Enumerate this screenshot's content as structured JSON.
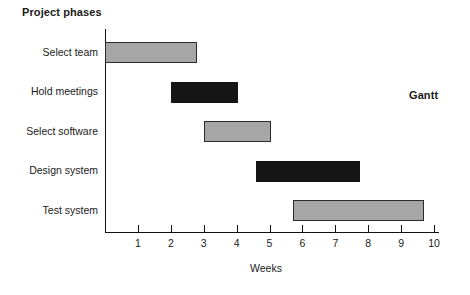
{
  "titles": {
    "phases": "Project phases",
    "gantt": "Gantt",
    "x_axis": "Weeks"
  },
  "chart_data": {
    "type": "bar",
    "orientation": "horizontal",
    "subtype": "gantt",
    "title": "Project phases",
    "annotation": "Gantt",
    "xlabel": "Weeks",
    "ylabel": "",
    "xlim": [
      0,
      10
    ],
    "grid": false,
    "legend": null,
    "xticks": [
      "1",
      "2",
      "3",
      "4",
      "5",
      "6",
      "7",
      "8",
      "9",
      "10"
    ],
    "categories": [
      "Select team",
      "Hold meetings",
      "Select software",
      "Design system",
      "Test system"
    ],
    "tasks": [
      {
        "name": "Select team",
        "start": 0,
        "end": 2.8,
        "duration": 2.8,
        "color": "#a6a6a6",
        "fill": "gray"
      },
      {
        "name": "Hold meetings",
        "start": 2,
        "end": 4.05,
        "duration": 2.05,
        "color": "#151515",
        "fill": "black"
      },
      {
        "name": "Select software",
        "start": 3,
        "end": 5.05,
        "duration": 2.05,
        "color": "#a6a6a6",
        "fill": "gray"
      },
      {
        "name": "Design system",
        "start": 4.6,
        "end": 7.75,
        "duration": 3.15,
        "color": "#151515",
        "fill": "black"
      },
      {
        "name": "Test system",
        "start": 5.7,
        "end": 9.7,
        "duration": 4.0,
        "color": "#a6a6a6",
        "fill": "gray"
      }
    ],
    "colors": {
      "bar_gray": "#a6a6a6",
      "bar_black": "#151515",
      "axis": "#111111",
      "text": "#1a1a1a",
      "background": "#ffffff"
    }
  }
}
